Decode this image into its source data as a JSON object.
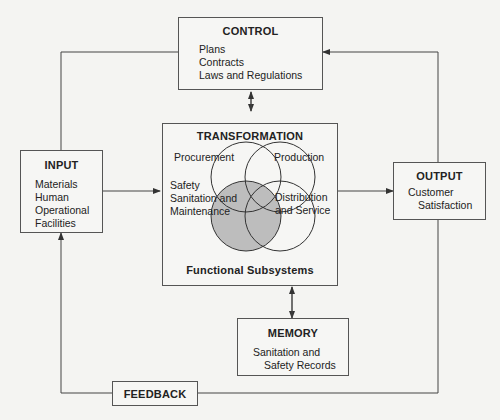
{
  "control": {
    "title": "CONTROL",
    "items": [
      "Plans",
      "Contracts",
      "Laws and Regulations"
    ]
  },
  "transformation": {
    "title": "TRANSFORMATION",
    "subsystems": {
      "procurement": "Procurement",
      "production": "Production",
      "safety_line1": "Safety",
      "safety_line2": "Sanitation and",
      "safety_line3": "Maintenance",
      "distribution_line1": "Distribution",
      "distribution_line2": "and Service"
    },
    "caption": "Functional Subsystems"
  },
  "input": {
    "title": "INPUT",
    "items": [
      "Materials",
      "Human",
      "Operational",
      "Facilities"
    ]
  },
  "output": {
    "title": "OUTPUT",
    "items": [
      "Customer",
      "Satisfaction"
    ]
  },
  "memory": {
    "title": "MEMORY",
    "items": [
      "Sanitation and",
      "Safety Records"
    ]
  },
  "feedback": {
    "title": "FEEDBACK"
  },
  "colors": {
    "line": "#444444",
    "shaded_circle": "#bdbdbd",
    "background": "#f4f4f2"
  }
}
